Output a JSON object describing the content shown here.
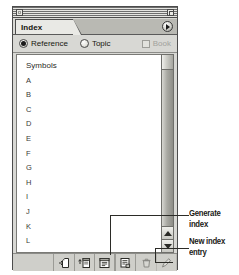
{
  "window": {
    "title": "Index",
    "close_box": "close-box",
    "zoom_box": "zoom-box",
    "popup_arrow": "popup-arrow-icon"
  },
  "tab": {
    "label": "Index"
  },
  "options": {
    "reference": {
      "label": "Reference",
      "selected": true
    },
    "topic": {
      "label": "Topic",
      "selected": false
    },
    "book": {
      "label": "Book",
      "checked": false,
      "disabled": true
    }
  },
  "list": {
    "items": [
      "Symbols",
      "A",
      "B",
      "C",
      "D",
      "E",
      "F",
      "G",
      "H",
      "I",
      "J",
      "K",
      "L"
    ]
  },
  "scrollbar": {
    "up_arrow": "scroll-up-arrow",
    "down_arrow": "scroll-down-arrow"
  },
  "toolbar": {
    "buttons": [
      {
        "name": "new-page-button",
        "icon": "new-page-icon",
        "disabled": false
      },
      {
        "name": "import-topics-button",
        "icon": "import-topics-icon",
        "disabled": false
      },
      {
        "name": "generate-index-button",
        "icon": "generate-index-icon",
        "disabled": false
      },
      {
        "name": "new-index-entry-button",
        "icon": "new-index-entry-icon",
        "disabled": false
      },
      {
        "name": "delete-button",
        "icon": "trash-icon",
        "disabled": true
      },
      {
        "name": "edit-button",
        "icon": "pencil-icon",
        "disabled": true
      }
    ]
  },
  "callouts": {
    "generate_index": {
      "line1": "Generate",
      "line2": "index"
    },
    "new_index_entry": {
      "line1": "New index",
      "line2": "entry"
    }
  },
  "colors": {
    "window_face": "#d8d8d4",
    "list_background": "#ffffff",
    "frame": "#4c4c4c",
    "text": "#17170f",
    "disabled_text": "#a2a29c"
  }
}
